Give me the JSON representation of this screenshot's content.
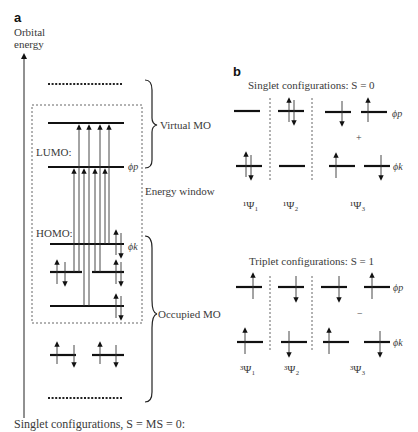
{
  "panel_a": {
    "label": "a",
    "axis_label_line1": "Orbital",
    "axis_label_line2": "energy",
    "lumo_label": "LUMO:",
    "homo_label": "HOMO:",
    "phi_p": "ϕp",
    "phi_k": "ϕk",
    "virtual_mo": "Virtual MO",
    "energy_window": "Energy window",
    "occupied_mo": "Occupied MO"
  },
  "panel_b": {
    "label": "b",
    "singlet_title": "Singlet configurations: S = 0",
    "triplet_title": "Triplet configurations: S = 1",
    "singlet_combination_sign": "+",
    "triplet_combination_sign": "−",
    "phi_p": "ϕp",
    "phi_k": "ϕk",
    "singlet_states": [
      "¹Ψ₁",
      "¹Ψ₂",
      "¹Ψ₃"
    ],
    "triplet_states": [
      "³Ψ₁",
      "³Ψ₂",
      "³Ψ₃"
    ]
  },
  "footer": {
    "caption": "Singlet configurations, S = MS = 0:"
  }
}
